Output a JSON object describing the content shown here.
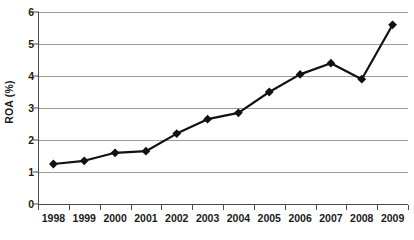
{
  "chart_data": {
    "type": "line",
    "title": "",
    "xlabel": "",
    "ylabel": "ROA (%)",
    "categories": [
      "1998",
      "1999",
      "2000",
      "2001",
      "2002",
      "2003",
      "2004",
      "2005",
      "2006",
      "2007",
      "2008",
      "2009"
    ],
    "values": [
      1.25,
      1.35,
      1.6,
      1.65,
      2.2,
      2.65,
      2.85,
      3.5,
      4.05,
      4.4,
      3.9,
      5.6
    ],
    "series": [
      {
        "name": "ROA (%)",
        "values": [
          1.25,
          1.35,
          1.6,
          1.65,
          2.2,
          2.65,
          2.85,
          3.5,
          4.05,
          4.4,
          3.9,
          5.6
        ]
      }
    ],
    "ylim": [
      0,
      6
    ],
    "yticks": [
      0,
      1,
      2,
      3,
      4,
      5,
      6
    ],
    "ytick_labels": [
      "0",
      "1",
      "2",
      "3",
      "4",
      "5",
      "6"
    ],
    "grid": true,
    "legend": false,
    "marker": "diamond",
    "line_color": "#111111",
    "marker_color": "#111111",
    "grid_color": "#9c9c9c",
    "axis_color": "#4a4a4a",
    "background": "#ffffff"
  }
}
